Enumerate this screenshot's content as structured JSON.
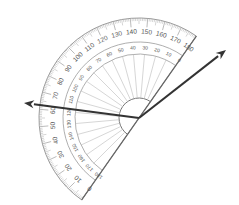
{
  "diagram": {
    "type": "protractor-angle-measurement",
    "canvas": {
      "width": 239,
      "height": 205,
      "background": "#ffffff"
    },
    "protractor": {
      "center": [
        139,
        118
      ],
      "base_angle_zero_deg": 235,
      "base_angle_180_deg": 55,
      "outer_radius": 100,
      "outer_scale_label_radius": 86,
      "inner_scale_outer_radius": 76,
      "inner_scale_label_radius": 70,
      "inner_arc_radius": 64,
      "center_arc_radius": 20,
      "outer_scale": {
        "labels": [
          "0",
          "10",
          "20",
          "30",
          "40",
          "50",
          "60",
          "70",
          "80",
          "90",
          "100",
          "110",
          "120",
          "130",
          "140",
          "150",
          "160",
          "170",
          "180"
        ],
        "direction": "0 at lower-left end, 180 at upper-right end"
      },
      "inner_scale": {
        "labels": [
          "180",
          "170",
          "160",
          "150",
          "140",
          "130",
          "120",
          "110",
          "100",
          "90",
          "80",
          "70",
          "60",
          "50",
          "40",
          "30",
          "20",
          "10",
          "0"
        ],
        "direction": "0 at upper-right end, 180 at lower-left end"
      },
      "stroke_color": "#9a9a9a",
      "fill_color": "#ffffff"
    },
    "rays": [
      {
        "name": "left-ray",
        "from": [
          139,
          118
        ],
        "to": [
          24,
          103
        ],
        "color": "#333333",
        "outer_scale_reading": "≈62"
      },
      {
        "name": "right-ray",
        "from": [
          139,
          118
        ],
        "to": [
          226,
          50
        ],
        "color": "#333333",
        "outer_scale_reading": "beyond 180 (outside scale)"
      }
    ]
  }
}
